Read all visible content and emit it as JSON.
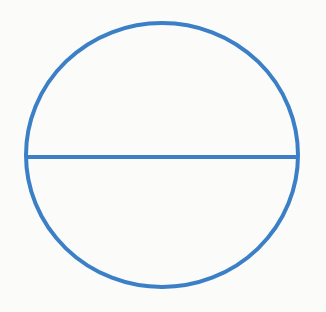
{
  "diagram": {
    "title": "",
    "shape": "circle-with-diameter",
    "stroke_color": "#3b7fc6",
    "background": "#fbfbfa",
    "circle": {
      "cx": 162,
      "cy": 155,
      "rx": 136,
      "ry": 132,
      "stroke_width": 4
    },
    "diameter": {
      "x1": 25,
      "y1": 157,
      "x2": 298,
      "y2": 157,
      "stroke_width": 4
    }
  }
}
